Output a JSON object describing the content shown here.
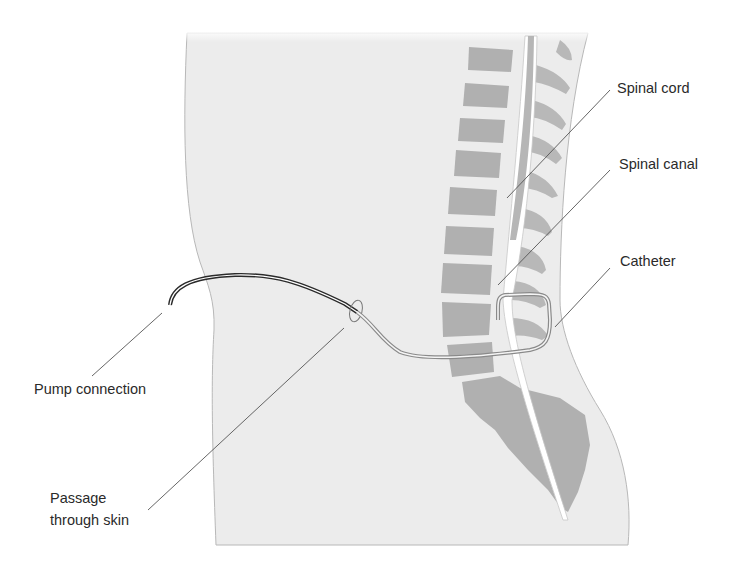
{
  "figure": {
    "colors": {
      "body_fill": "#ececec",
      "body_outline": "#b8b8b8",
      "vertebra": "#b0b0b0",
      "cord": "#b6b6b6",
      "canal": "#ffffff",
      "catheter_external": "#2a2a2a",
      "catheter_internal": "#8a8a8a",
      "leader_line": "#555555",
      "text": "#2a2a2a"
    }
  },
  "labels": {
    "spinal_cord": "Spinal cord",
    "spinal_canal": "Spinal canal",
    "catheter": "Catheter",
    "pump_connection": "Pump connection",
    "passage_line1": "Passage",
    "passage_line2": "through skin"
  }
}
